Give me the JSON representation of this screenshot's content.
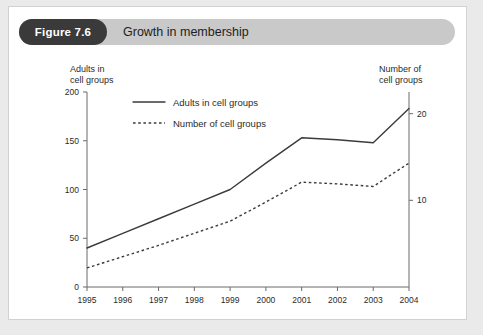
{
  "figure": {
    "badge": "Figure 7.6",
    "title": "Growth in membership"
  },
  "axes": {
    "left_title_line1": "Adults in",
    "left_title_line2": "cell groups",
    "right_title_line1": "Number of",
    "right_title_line2": "cell groups"
  },
  "legend": {
    "entry_solid": "Adults in cell groups",
    "entry_dotted": "Number of cell groups"
  },
  "colors": {
    "badge_bg": "#3a3a3a",
    "titlebar_bg": "#c9c9c9",
    "card_bg": "#ffffff",
    "page_bg": "#eaeaea",
    "ink": "#3b3b3b",
    "axis": "#6b6b6b"
  },
  "chart_data": {
    "type": "line",
    "title": "Growth in membership",
    "xlabel": "",
    "ylabel": "Adults in cell groups",
    "y2label": "Number of cell groups",
    "categories": [
      "1995",
      "1996",
      "1997",
      "1998",
      "1999",
      "2000",
      "2001",
      "2002",
      "2003",
      "2004"
    ],
    "ylim": [
      0,
      200
    ],
    "yticks": [
      0,
      50,
      100,
      150,
      200
    ],
    "y2lim": [
      0,
      22.5
    ],
    "y2ticks": [
      10,
      20
    ],
    "grid": false,
    "legend_position": "top-left-inside",
    "series": [
      {
        "name": "Adults in cell groups",
        "axis": "left",
        "style": "solid",
        "values": [
          40,
          55,
          70,
          85,
          100,
          127,
          153,
          151,
          148,
          183
        ]
      },
      {
        "name": "Number of cell groups",
        "axis": "right",
        "style": "dotted",
        "values": [
          2.2,
          3.5,
          4.8,
          6.2,
          7.6,
          9.8,
          12.1,
          11.9,
          11.6,
          14.3
        ]
      }
    ]
  }
}
